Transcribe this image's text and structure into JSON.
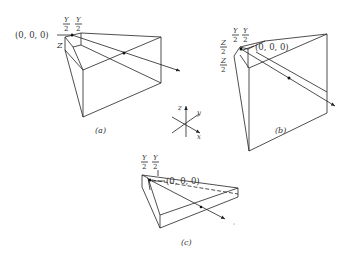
{
  "figure": {
    "panels": [
      {
        "id": "a",
        "caption": "(a)",
        "origin_label": "(0, 0, 0)",
        "dim_labels": {
          "y_num_1": "Y",
          "y_den_1": "2",
          "y_num_2": "Y",
          "y_den_2": "2",
          "z": "Z"
        }
      },
      {
        "id": "b",
        "caption": "(b)",
        "origin_label": "(0, 0, 0)",
        "dim_labels": {
          "y_num_1": "Y",
          "y_den_1": "2",
          "y_num_2": "Y",
          "y_den_2": "2",
          "z_num_1": "Z",
          "z_den_1": "2",
          "z_num_2": "Z",
          "z_den_2": "2"
        }
      },
      {
        "id": "c",
        "caption": "(c)",
        "origin_label": "(0, 0, 0)",
        "dim_labels": {
          "y_num_1": "Y",
          "y_den_1": "2",
          "y_num_2": "Y",
          "y_den_2": "2"
        }
      }
    ],
    "axes": {
      "z": "z",
      "y": "y",
      "x": "x"
    }
  }
}
